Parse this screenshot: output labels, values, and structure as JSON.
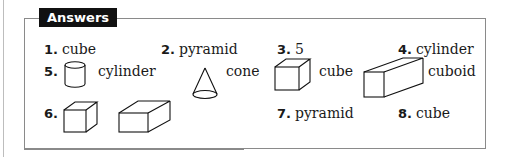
{
  "title": "Answers",
  "answers": [
    {
      "num": "1.",
      "text": "cube"
    },
    {
      "num": "2.",
      "text": "pyramid"
    },
    {
      "num": "3.",
      "text": "5"
    },
    {
      "num": "4.",
      "text": "cylinder"
    },
    {
      "num": "5.",
      "shapes": [
        {
          "icon": "cylinder-icon",
          "label": "cylinder"
        },
        {
          "icon": "cone-icon",
          "label": "cone"
        },
        {
          "icon": "cube-icon",
          "label": "cube"
        },
        {
          "icon": "cuboid-icon",
          "label": "cuboid"
        }
      ]
    },
    {
      "num": "6.",
      "shapes": [
        {
          "icon": "cube-icon"
        },
        {
          "icon": "cuboid-icon"
        }
      ]
    },
    {
      "num": "7.",
      "text": "pyramid"
    },
    {
      "num": "8.",
      "text": "cube"
    }
  ]
}
